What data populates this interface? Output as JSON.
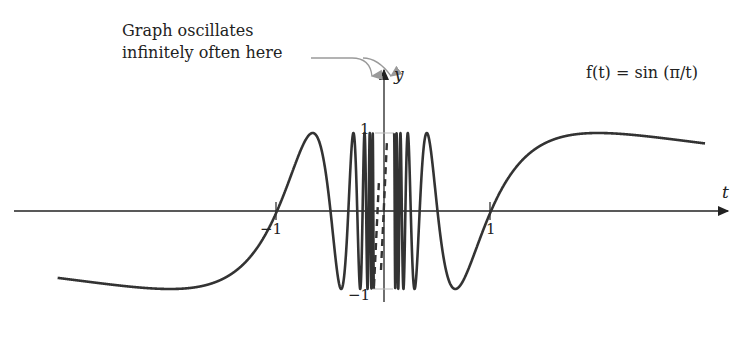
{
  "annotation": {
    "line1": "Graph oscillates",
    "line2": "infinitely often here"
  },
  "function_label": "f(t) = sin (π/t)",
  "axes": {
    "x_label": "t",
    "y_label": "y",
    "x_ticks": [
      "−1",
      "1"
    ],
    "y_ticks": [
      "1",
      "−1"
    ]
  },
  "colors": {
    "curve": "#333333",
    "axis": "#222222",
    "annotation_arrow": "#9a9a9a",
    "guide_line": "#bbbbbb"
  },
  "chart_data": {
    "type": "line",
    "title": "",
    "function": "f(t) = sin(pi/t)",
    "xlabel": "t",
    "ylabel": "y",
    "xlim": [
      -3.05,
      3.0
    ],
    "ylim": [
      -1,
      1
    ],
    "x_ticks": [
      -1,
      1
    ],
    "y_ticks": [
      -1,
      1
    ],
    "grid": false,
    "annotations": [
      "Graph oscillates infinitely often here"
    ]
  }
}
